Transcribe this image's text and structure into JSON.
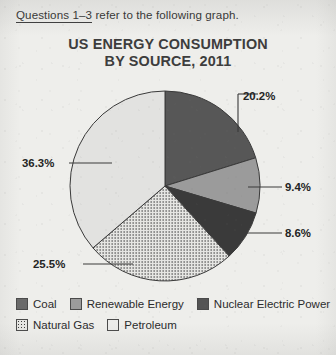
{
  "page": {
    "background_color": "#eeeeeb",
    "text_color": "#2b2b2b"
  },
  "header": {
    "question_range": "Questions 1–3",
    "rest": " refer to the following graph."
  },
  "chart_data": {
    "type": "pie",
    "title": "US ENERGY CONSUMPTION BY SOURCE, 2011",
    "title_line1": "US ENERGY CONSUMPTION",
    "title_line2": "BY SOURCE, 2011",
    "unit": "%",
    "start_angle_deg": 0,
    "direction": "clockwise",
    "categories": [
      "Coal",
      "Renewable Energy",
      "Nuclear Electric Power",
      "Natural Gas",
      "Petroleum"
    ],
    "values": [
      20.2,
      9.4,
      8.6,
      25.5,
      36.3
    ],
    "labels": [
      "20.2%",
      "9.4%",
      "8.6%",
      "25.5%",
      "36.3%"
    ],
    "colors": [
      "#575757",
      "#9b9b9b",
      "#3a3a3a",
      "#e6e6e3",
      "#e2e2e0"
    ],
    "patterns": [
      "solid",
      "solid",
      "solid",
      "dotted",
      "solid"
    ],
    "legend_position": "bottom",
    "grid": false,
    "slices": [
      {
        "name": "Coal",
        "value": 20.2,
        "label": "20.2%",
        "color": "#575757",
        "pattern": "solid"
      },
      {
        "name": "Renewable Energy",
        "value": 9.4,
        "label": "9.4%",
        "color": "#9b9b9b",
        "pattern": "solid"
      },
      {
        "name": "Nuclear Electric Power",
        "value": 8.6,
        "label": "8.6%",
        "color": "#3a3a3a",
        "pattern": "solid"
      },
      {
        "name": "Natural Gas",
        "value": 25.5,
        "label": "25.5%",
        "color": "#e6e6e3",
        "pattern": "dotted"
      },
      {
        "name": "Petroleum",
        "value": 36.3,
        "label": "36.3%",
        "color": "#e2e2e0",
        "pattern": "solid"
      }
    ]
  },
  "legend": {
    "rows": [
      [
        {
          "label": "Coal",
          "color": "#6a6a6a",
          "pattern": "solid"
        },
        {
          "label": "Renewable Energy",
          "color": "#9b9b9b",
          "pattern": "solid"
        },
        {
          "label": "Nuclear Electric Power",
          "color": "#545454",
          "pattern": "solid"
        }
      ],
      [
        {
          "label": "Natural Gas",
          "color": "#e6e6e3",
          "pattern": "dotted"
        },
        {
          "label": "Petroleum",
          "color": "#ececea",
          "pattern": "solid"
        }
      ]
    ]
  }
}
